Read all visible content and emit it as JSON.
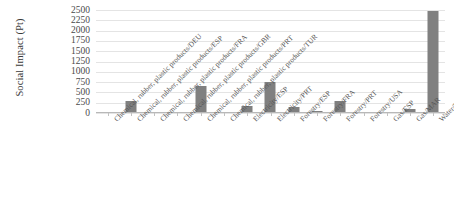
{
  "chart_data": {
    "type": "bar",
    "title": "",
    "xlabel": "",
    "ylabel": "Social Impact (Pt)",
    "ylim": [
      0,
      2500
    ],
    "ytick_step": 250,
    "yticks": [
      "2500",
      "2250",
      "2000",
      "1750",
      "1500",
      "1250",
      "1000",
      "750",
      "500",
      "250",
      "0"
    ],
    "grid": true,
    "legend": "none",
    "bar_color": "#808080",
    "gridline_color": "#e4e4e4",
    "axis_color": "#b8b8b8",
    "categories": [
      "Chemical, rubber, plastic products/DEU",
      "Chemical, rubber, plastic products/ESP",
      "Chemical, rubber, plastic products/FRA",
      "Chemical, rubber, plastic products/GBR",
      "Chemical, rubber, plastic products/PRT",
      "Chemical, rubber, plastic products/TUR",
      "Electricity/ESP",
      "Electricity/PRT",
      "Forestry/ESP",
      "Forestry/FRA",
      "Forestry/PRT",
      "Forestry/USA",
      "Gas/ESP",
      "Gas/MAR",
      "Water/PRT"
    ],
    "values": [
      20,
      290,
      25,
      20,
      660,
      30,
      160,
      750,
      150,
      40,
      300,
      15,
      15,
      100,
      2480
    ]
  }
}
